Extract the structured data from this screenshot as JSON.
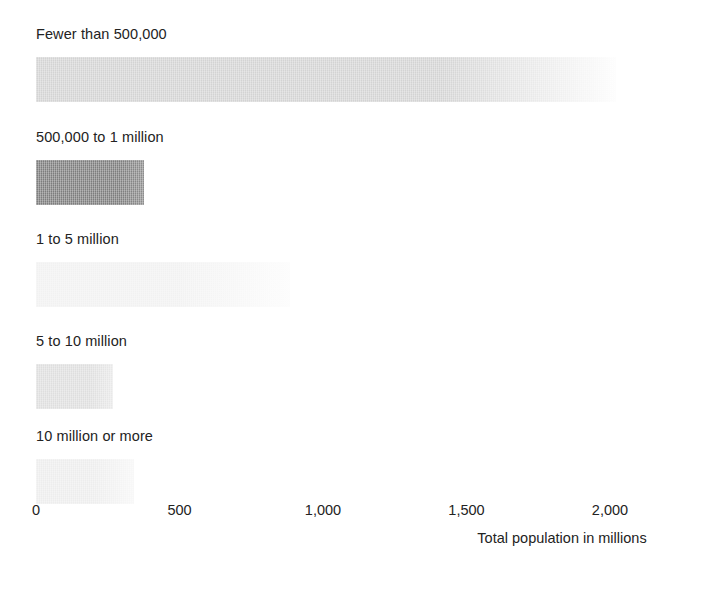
{
  "chart_data": {
    "type": "bar",
    "orientation": "horizontal",
    "title": "",
    "subtitle": "",
    "xlabel": "Total population in millions",
    "ylabel": "",
    "xlim": [
      0,
      2000
    ],
    "xticks": [
      0,
      500,
      1000,
      1500,
      2000
    ],
    "xtick_labels": [
      "0",
      "500",
      "1,000",
      "1,500",
      "2,000"
    ],
    "grid": false,
    "legend": "none",
    "categories": [
      "Fewer than 500,000",
      "500,000 to 1 million",
      "1 to 5 million",
      "5 to 10 million",
      "10 million or more"
    ],
    "values": [
      2020,
      378,
      885,
      270,
      340
    ],
    "bar_colors": [
      "#d3d3d3",
      "#808080",
      "#f0f0f0",
      "#e0e0e0",
      "#ececec"
    ],
    "bars": [
      {
        "label": "Fewer than 500,000",
        "value": 2020,
        "color": "#d3d3d3",
        "fade_to": "#fdfdfd",
        "fade_start_pct": 70
      },
      {
        "label": "500,000 to 1 million",
        "value": 378,
        "color": "#7d7d7d",
        "fade_to": "#8d8d8d",
        "fade_start_pct": 78
      },
      {
        "label": "1 to 5 million",
        "value": 885,
        "color": "#f1f1f1",
        "fade_to": "#fcfcfc",
        "fade_start_pct": 55
      },
      {
        "label": "5 to 10 million",
        "value": 270,
        "color": "#dedede",
        "fade_to": "#e9e9e9",
        "fade_start_pct": 70
      },
      {
        "label": "10 million or more",
        "value": 340,
        "color": "#ededed",
        "fade_to": "#f7f7f7",
        "fade_start_pct": 60
      }
    ]
  },
  "axis": {
    "title": "Total population in millions",
    "ticks": [
      {
        "label": "0",
        "value": 0
      },
      {
        "label": "500",
        "value": 500
      },
      {
        "label": "1,000",
        "value": 1000
      },
      {
        "label": "1,500",
        "value": 1500
      },
      {
        "label": "2,000",
        "value": 2000
      }
    ]
  }
}
